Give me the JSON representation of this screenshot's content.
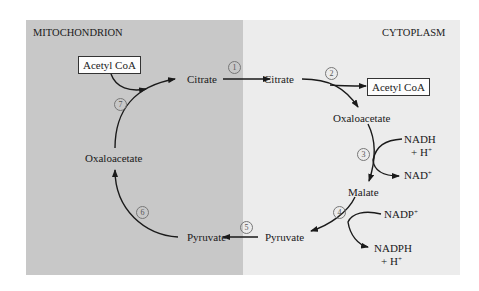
{
  "regions": {
    "left": {
      "label": "MITOCHONDRION",
      "color": "#c9c9c9"
    },
    "right": {
      "label": "CYTOPLASM",
      "color": "#ececec"
    }
  },
  "nodes": {
    "acetyl_coa_mito": "Acetyl CoA",
    "citrate_mito": "Citrate",
    "citrate_cyto": "Citrate",
    "acetyl_coa_cyto": "Acetyl CoA",
    "oxaloacetate_cyto": "Oxaloacetate",
    "nadh": "NADH",
    "h_plus_1": "+ H",
    "nad_plus": "NAD",
    "malate": "Malate",
    "nadp_plus": "NADP",
    "nadph": "NADPH",
    "h_plus_2": "+ H",
    "pyruvate_cyto": "Pyruvate",
    "pyruvate_mito": "Pyruvate",
    "oxaloacetate_mito": "Oxaloacetate",
    "plus_sign": "+"
  },
  "steps": [
    "1",
    "2",
    "3",
    "4",
    "5",
    "6",
    "7"
  ],
  "colors": {
    "arrow": "#1a1a1a",
    "step_circle": "#777777",
    "box_border": "#333333"
  }
}
